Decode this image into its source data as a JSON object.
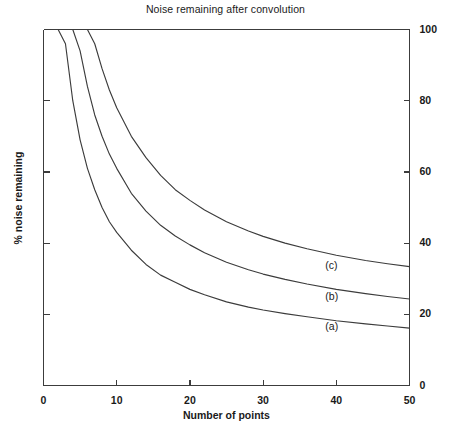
{
  "chart_data": {
    "type": "line",
    "title": "Noise remaining after convolution",
    "xlabel": "Number of points",
    "ylabel": "% noise remaining",
    "xlim": [
      0,
      50
    ],
    "ylim": [
      0,
      100
    ],
    "xticks": [
      0,
      10,
      20,
      30,
      40,
      50
    ],
    "xtick_labels": [
      "0",
      "10",
      "20",
      "30",
      "40",
      "50"
    ],
    "yticks": [
      0,
      20,
      40,
      60,
      80,
      100
    ],
    "ytick_labels": [
      "0",
      "20",
      "40",
      "60",
      "80",
      "100"
    ],
    "ytick_side": "right",
    "left_axis_ticks_unlabeled": true,
    "grid": false,
    "legend": "inline-annotations",
    "x": [
      1,
      2,
      3,
      4,
      5,
      6,
      7,
      8,
      9,
      10,
      12,
      14,
      16,
      18,
      20,
      22,
      25,
      28,
      30,
      33,
      36,
      40,
      44,
      47,
      50
    ],
    "series": [
      {
        "name": "(a)",
        "label": "(a)",
        "label_x": 38.5,
        "label_y": 16.5,
        "values": [
          100,
          100,
          96,
          80,
          69,
          61,
          55,
          50,
          46,
          43,
          38,
          34,
          31,
          29,
          27,
          25.5,
          23.5,
          22,
          21.2,
          20.2,
          19.3,
          18.2,
          17.3,
          16.7,
          16.1
        ]
      },
      {
        "name": "(b)",
        "label": "(b)",
        "label_x": 38.5,
        "label_y": 25.0,
        "values": [
          100,
          100,
          100,
          100,
          94,
          84,
          76,
          70,
          65,
          61,
          54,
          49,
          45,
          42,
          39.5,
          37.3,
          34.6,
          32.5,
          31.3,
          29.8,
          28.5,
          27.0,
          25.8,
          25.0,
          24.3
        ]
      },
      {
        "name": "(c)",
        "label": "(c)",
        "label_x": 38.5,
        "label_y": 33.5,
        "values": [
          100,
          100,
          100,
          100,
          100,
          100,
          96,
          89,
          83,
          78,
          70,
          64,
          59,
          55,
          52,
          49.3,
          46.0,
          43.4,
          41.9,
          40.0,
          38.4,
          36.6,
          35.1,
          34.2,
          33.4
        ]
      }
    ],
    "axis_color": "#3c3c3c",
    "curve_color": "#3c3c3c"
  }
}
